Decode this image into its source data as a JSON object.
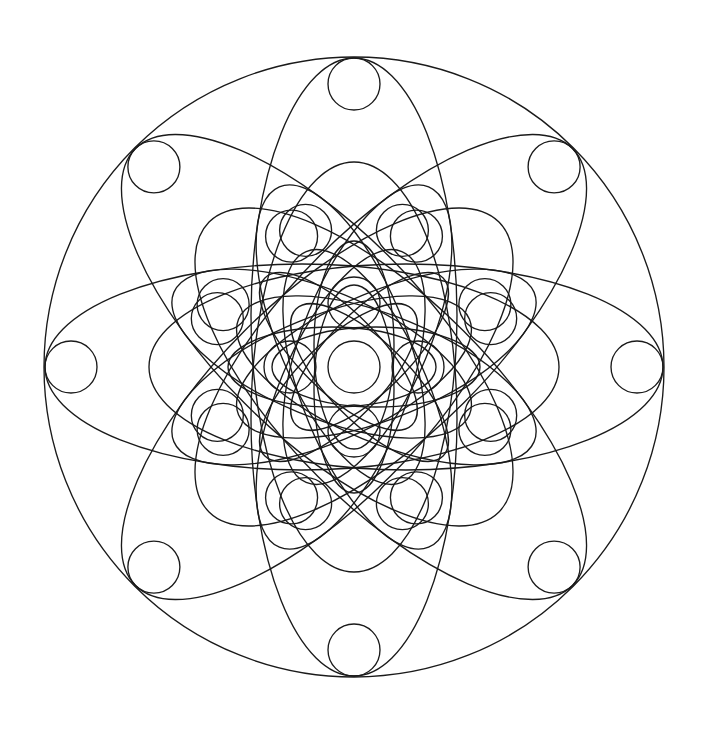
{
  "artwork": {
    "title": "Geometric Mandala Line Drawing",
    "kind": "coloring-page-mandala",
    "background_color": "#ffffff",
    "stroke_color": "#1a1a1a",
    "stroke_width": 1.35,
    "canvas": {
      "width": 701,
      "height": 734
    },
    "symmetry_order": 8,
    "center": {
      "x": 354,
      "y": 367
    }
  },
  "geometry": {
    "outer_circle": {
      "cx": 354,
      "cy": 367,
      "r": 310
    },
    "petal_ellipses_large": {
      "count": 8,
      "rx": 103,
      "ry": 257,
      "offset_from_center": 52,
      "start_angle_deg": 0,
      "angle_step_deg": 45
    },
    "petal_ellipses_mid": {
      "count": 8,
      "rx": 63,
      "ry": 160,
      "offset_from_center": 35,
      "start_angle_deg": 22.5,
      "angle_step_deg": 45
    },
    "petal_ellipses_small": {
      "count": 8,
      "rx": 40,
      "ry": 104,
      "offset_from_center": 22,
      "start_angle_deg": 0,
      "angle_step_deg": 45
    },
    "circle_radius": 26,
    "circle_rings": [
      {
        "name": "outer-ring",
        "count": 8,
        "radius": 283,
        "start_angle_deg": 90,
        "angle_step_deg": 45
      },
      {
        "name": "mid-ring",
        "count": 8,
        "radius": 145,
        "start_angle_deg": 70.5,
        "angle_step_deg": 45
      },
      {
        "name": "mid-ring-b",
        "count": 8,
        "radius": 145,
        "start_angle_deg": 19.5,
        "angle_step_deg": 45
      },
      {
        "name": "inner-cross",
        "count": 4,
        "radius": 64,
        "start_angle_deg": 90,
        "angle_step_deg": 90
      }
    ],
    "center_circle": {
      "cx": 354,
      "cy": 367,
      "r": 26
    }
  },
  "labels": {
    "outer_circle": "outer-boundary-circle",
    "center_circle": "center-circle",
    "petal_group_large": "large-petal-ring",
    "petal_group_mid": "mid-petal-ring",
    "petal_group_small": "small-petal-ring",
    "circle_group": "small-circle-ring"
  }
}
